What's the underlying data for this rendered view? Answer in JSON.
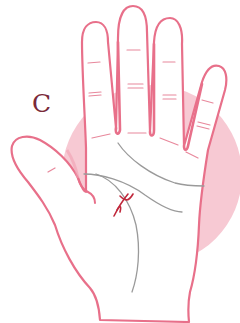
{
  "diagram": {
    "label": "C",
    "colors": {
      "background_circle": "#f7c9d3",
      "hand_outline": "#e8708a",
      "hand_fill": "#ffffff",
      "palm_lines": "#9a9a9a",
      "crease_lines": "#e8889c",
      "mark": "#c0283c",
      "label": "#7a2a3a"
    },
    "elements": [
      "pink background circle",
      "open right-hand palm outline",
      "finger crease marks",
      "heart line",
      "head line",
      "life line",
      "red cross mark between head and life lines"
    ]
  }
}
